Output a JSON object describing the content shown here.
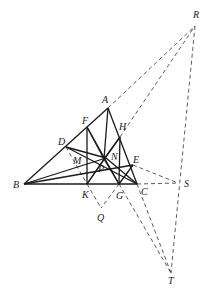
{
  "figure": {
    "points": {
      "A": {
        "label": "A",
        "x": 108,
        "y": 108,
        "lx": 102,
        "ly": 103
      },
      "B": {
        "label": "B",
        "x": 24,
        "y": 184,
        "lx": 13,
        "ly": 188
      },
      "C": {
        "label": "C",
        "x": 137,
        "y": 184,
        "lx": 141,
        "ly": 195
      },
      "D": {
        "label": "D",
        "x": 66,
        "y": 147,
        "lx": 58,
        "ly": 145
      },
      "E": {
        "label": "E",
        "x": 133,
        "y": 165,
        "lx": 133,
        "ly": 163
      },
      "F": {
        "label": "F",
        "x": 87,
        "y": 127,
        "lx": 82,
        "ly": 124
      },
      "G": {
        "label": "G",
        "x": 119,
        "y": 184,
        "lx": 116,
        "ly": 199
      },
      "H": {
        "label": "H",
        "x": 120,
        "y": 137,
        "lx": 119,
        "ly": 130
      },
      "K": {
        "label": "K",
        "x": 87,
        "y": 184,
        "lx": 82,
        "ly": 198
      },
      "M": {
        "label": "M",
        "x": 78,
        "y": 163,
        "lx": 73,
        "ly": 164
      },
      "N": {
        "label": "N",
        "x": 106,
        "y": 158,
        "lx": 111,
        "ly": 160
      },
      "P": {
        "label": "P",
        "x": 104,
        "y": 159,
        "lx": 98,
        "ly": 172
      },
      "Q": {
        "label": "Q",
        "x": 101,
        "y": 208,
        "lx": 97,
        "ly": 221
      },
      "R": {
        "label": "R",
        "x": 195,
        "y": 26,
        "lx": 193,
        "ly": 18
      },
      "S": {
        "label": "S",
        "x": 178,
        "y": 183,
        "lx": 184,
        "ly": 187
      },
      "T": {
        "label": "T",
        "x": 171,
        "y": 273,
        "lx": 168,
        "ly": 284
      }
    },
    "solid_segments": [
      [
        "A",
        "B"
      ],
      [
        "B",
        "C"
      ],
      [
        "A",
        "C"
      ],
      [
        "A",
        "P"
      ],
      [
        "F",
        "K"
      ],
      [
        "H",
        "G"
      ],
      [
        "B",
        "N"
      ],
      [
        "B",
        "E"
      ],
      [
        "D",
        "N"
      ],
      [
        "D",
        "C"
      ],
      [
        "F",
        "P"
      ],
      [
        "F",
        "G"
      ],
      [
        "P",
        "K"
      ],
      [
        "P",
        "G"
      ],
      [
        "H",
        "K"
      ],
      [
        "N",
        "C"
      ],
      [
        "H",
        "P"
      ],
      [
        "G",
        "E"
      ]
    ],
    "dashed_segments": [
      [
        "A",
        "R"
      ],
      [
        "H",
        "R"
      ],
      [
        "R",
        "T"
      ],
      [
        "E",
        "S"
      ],
      [
        "C",
        "S"
      ],
      [
        "D",
        "K"
      ],
      [
        "K",
        "Q"
      ],
      [
        "G",
        "Q"
      ],
      [
        "G",
        "T"
      ],
      [
        "C",
        "T"
      ]
    ]
  }
}
